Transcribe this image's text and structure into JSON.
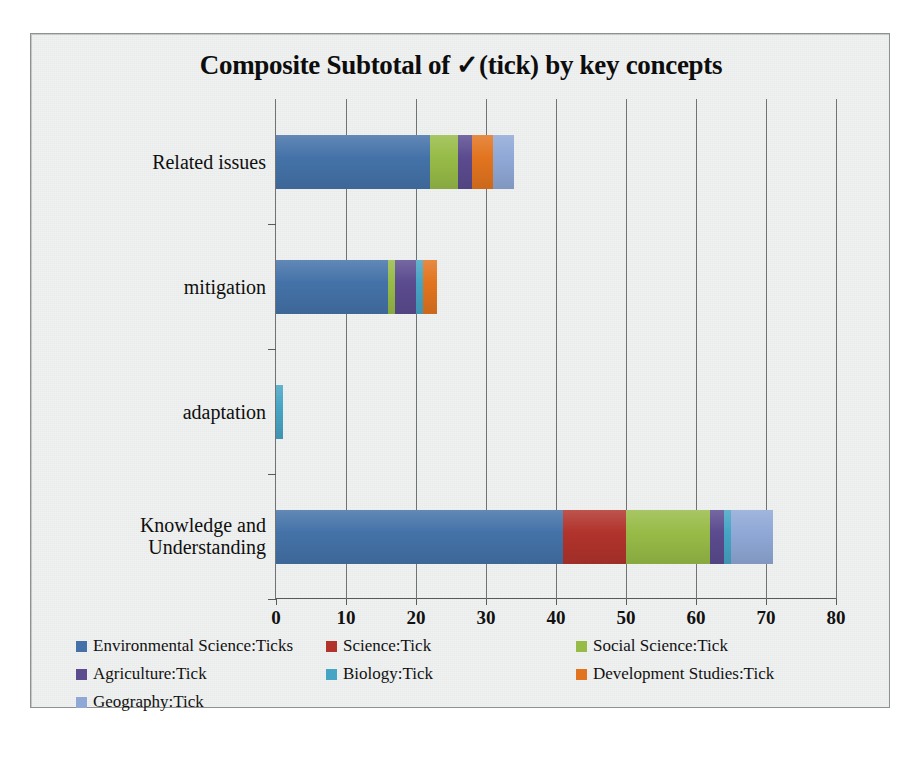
{
  "chart_data": {
    "type": "bar",
    "orientation": "horizontal",
    "stacked": true,
    "title": "Composite Subtotal of ✓(tick) by key concepts",
    "xlabel": "",
    "ylabel": "",
    "xlim": [
      0,
      80
    ],
    "x_ticks": [
      0,
      10,
      20,
      30,
      40,
      50,
      60,
      70,
      80
    ],
    "grid": "vertical",
    "legend_position": "bottom",
    "categories": [
      "Related issues",
      "mitigation",
      "adaptation",
      "Knowledge and Understanding"
    ],
    "series": [
      {
        "name": "Environmental Science:Ticks",
        "color": "#4472a8",
        "values": [
          22,
          16,
          0,
          41
        ]
      },
      {
        "name": "Science:Tick",
        "color": "#b1332c",
        "values": [
          0,
          0,
          0,
          9
        ]
      },
      {
        "name": "Social Science:Tick",
        "color": "#97bb47",
        "values": [
          4,
          1,
          0,
          12
        ]
      },
      {
        "name": "Agriculture:Tick",
        "color": "#5b4b8f",
        "values": [
          2,
          3,
          0,
          2
        ]
      },
      {
        "name": "Biology:Tick",
        "color": "#46a4c4",
        "values": [
          0,
          1,
          1,
          1
        ]
      },
      {
        "name": "Development Studies:Tick",
        "color": "#e2741f",
        "values": [
          3,
          2,
          0,
          0
        ]
      },
      {
        "name": "Geography:Tick",
        "color": "#8fa8d6",
        "values": [
          3,
          0,
          0,
          6
        ]
      }
    ],
    "totals": [
      34,
      23,
      1,
      71
    ]
  },
  "legend": {
    "rows": [
      [
        "Environmental Science:Ticks",
        "Science:Tick",
        "Social Science:Tick"
      ],
      [
        "Agriculture:Tick",
        "Biology:Tick",
        "Development Studies:Tick"
      ],
      [
        "Geography:Tick"
      ]
    ]
  }
}
